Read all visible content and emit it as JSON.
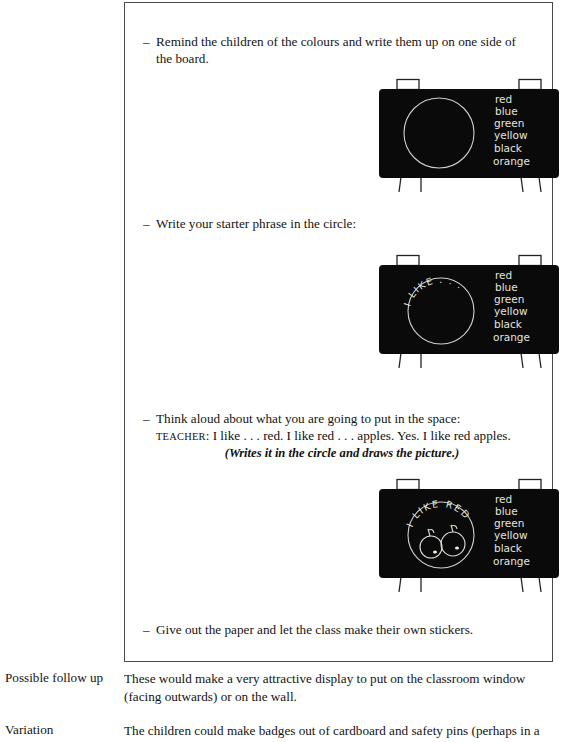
{
  "page": {
    "background_color": "#ffffff",
    "text_color": "#141414",
    "frame_border_color": "#4a4a4a"
  },
  "activity_box": {
    "steps": [
      {
        "bullet": "–",
        "text": "Remind the children of the colours and write them up on one side of the board."
      },
      {
        "bullet": "–",
        "text": "Write your starter phrase in the circle:"
      },
      {
        "bullet": "–",
        "text": "Think aloud about what you are going to put in the space:"
      },
      {
        "bullet": "–",
        "text": "Give out the paper and let the class make their own stickers."
      }
    ],
    "dialogue": {
      "speaker": "TEACHER",
      "separator": ":",
      "line": "I like . . . red. I like red . . . apples. Yes. I like red apples.",
      "stage_direction": "(Writes it in the circle and draws the picture.)"
    },
    "boards": [
      {
        "name": "blackboard-colours-only",
        "circle_text": "",
        "circle_drawing": "none",
        "colour_list": [
          "red",
          "blue",
          "green",
          "yellow",
          "black",
          "orange"
        ],
        "board_color": "#0a0a0a",
        "chalk_color": "#e8e8e4"
      },
      {
        "name": "blackboard-starter-phrase",
        "circle_text": "I LIKE . . .",
        "circle_drawing": "none",
        "colour_list": [
          "red",
          "blue",
          "green",
          "yellow",
          "black",
          "orange"
        ],
        "board_color": "#0a0a0a",
        "chalk_color": "#e8e8e4"
      },
      {
        "name": "blackboard-completed-example",
        "circle_text": "I LIKE RED",
        "circle_drawing": "two-red-apples",
        "colour_list": [
          "red",
          "blue",
          "green",
          "yellow",
          "black",
          "orange"
        ],
        "board_color": "#0a0a0a",
        "chalk_color": "#e8e8e4"
      }
    ]
  },
  "notes": [
    {
      "label": "Possible follow up",
      "body": "These would make a very attractive display to put on the classroom window (facing outwards) or on the wall."
    },
    {
      "label": "Variation",
      "body": "The children could make badges out of cardboard and safety pins (perhaps in a"
    }
  ]
}
